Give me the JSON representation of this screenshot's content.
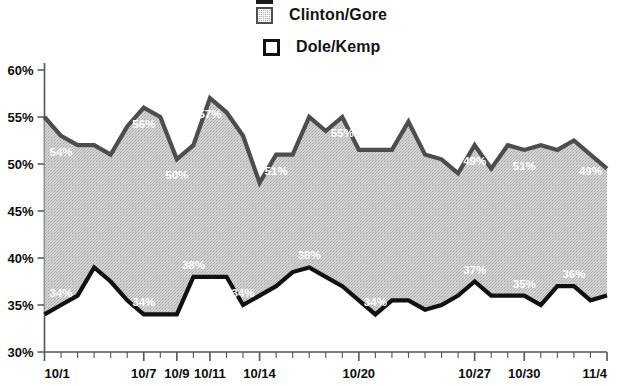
{
  "legend": {
    "items": [
      {
        "label": "Perot/Choate",
        "swatch": "perot",
        "clipped": true
      },
      {
        "label": "Clinton/Gore",
        "swatch": "clinton",
        "clipped": false
      },
      {
        "label": "Dole/Kemp",
        "swatch": "dole",
        "clipped": false
      }
    ]
  },
  "colors": {
    "clinton_line": "#4d4d4d",
    "clinton_fill": "#c9c9c9",
    "dole_line": "#111111",
    "axis": "#555555",
    "label_text": "#ffffff",
    "tick_text": "#0d0d0d"
  },
  "chart_data": {
    "type": "area",
    "title": "",
    "xlabel": "",
    "ylabel": "",
    "ylim": [
      30,
      60
    ],
    "ytick_step": 5,
    "ytick_labels": [
      "60%",
      "55%",
      "50%",
      "45%",
      "40%",
      "35%",
      "30%"
    ],
    "ytick_values": [
      60,
      55,
      50,
      45,
      40,
      35,
      30
    ],
    "grid": false,
    "legend_position": "top-center",
    "x": [
      "10/1",
      "10/2",
      "10/3",
      "10/4",
      "10/5",
      "10/6",
      "10/7",
      "10/8",
      "10/9",
      "10/10",
      "10/11",
      "10/12",
      "10/13",
      "10/14",
      "10/15",
      "10/16",
      "10/17",
      "10/18",
      "10/19",
      "10/20",
      "10/21",
      "10/22",
      "10/23",
      "10/24",
      "10/25",
      "10/26",
      "10/27",
      "10/28",
      "10/29",
      "10/30",
      "10/31",
      "11/1",
      "11/2",
      "11/3",
      "11/4"
    ],
    "xtick_labels": [
      {
        "index": 0,
        "text": "10/1"
      },
      {
        "index": 6,
        "text": "10/7"
      },
      {
        "index": 8,
        "text": "10/9"
      },
      {
        "index": 10,
        "text": "10/11"
      },
      {
        "index": 13,
        "text": "10/14"
      },
      {
        "index": 19,
        "text": "10/20"
      },
      {
        "index": 26,
        "text": "10/27"
      },
      {
        "index": 29,
        "text": "10/30"
      },
      {
        "index": 34,
        "text": "11/4"
      }
    ],
    "series": [
      {
        "name": "Clinton/Gore",
        "values": [
          55,
          53,
          52,
          52,
          51,
          54,
          56,
          55,
          50.5,
          52,
          57,
          55.5,
          53,
          48,
          51,
          51,
          55,
          53.5,
          55,
          51.5,
          51.5,
          51.5,
          54.5,
          51,
          50.5,
          49,
          52,
          49.5,
          52,
          51.5,
          52,
          51.5,
          52.5,
          51,
          49.5
        ],
        "point_labels": [
          {
            "index": 1,
            "text": "54%"
          },
          {
            "index": 6,
            "text": "56%"
          },
          {
            "index": 8,
            "text": "50%"
          },
          {
            "index": 10,
            "text": "57%"
          },
          {
            "index": 14,
            "text": "51%"
          },
          {
            "index": 18,
            "text": "55%"
          },
          {
            "index": 26,
            "text": "49%"
          },
          {
            "index": 29,
            "text": "51%"
          },
          {
            "index": 33,
            "text": "49%"
          }
        ]
      },
      {
        "name": "Dole/Kemp",
        "values": [
          34,
          35,
          36,
          39,
          37.5,
          35.5,
          34,
          34,
          34,
          38,
          38,
          38,
          35,
          36,
          37,
          38.5,
          39,
          38,
          37,
          35.5,
          34,
          35.5,
          35.5,
          34.5,
          35,
          36,
          37.5,
          36,
          36,
          36,
          35,
          37,
          37,
          35.5,
          36
        ],
        "point_labels": [
          {
            "index": 1,
            "text": "34%"
          },
          {
            "index": 6,
            "text": "34%"
          },
          {
            "index": 9,
            "text": "38%"
          },
          {
            "index": 12,
            "text": "34%"
          },
          {
            "index": 16,
            "text": "38%"
          },
          {
            "index": 20,
            "text": "34%"
          },
          {
            "index": 26,
            "text": "37%"
          },
          {
            "index": 29,
            "text": "35%"
          },
          {
            "index": 32,
            "text": "36%"
          }
        ]
      }
    ]
  }
}
